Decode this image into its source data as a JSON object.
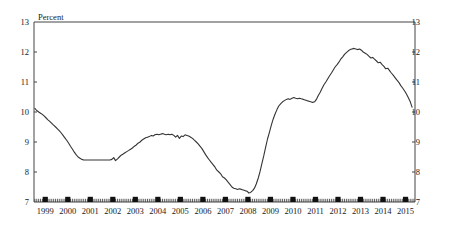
{
  "chart_data": {
    "type": "line",
    "title": "",
    "unit_label": "Percent",
    "xlabel": "",
    "ylabel": "Percent",
    "ylim": [
      7,
      13
    ],
    "yticks": [
      7,
      8,
      9,
      10,
      11,
      12,
      13
    ],
    "ytick_labels": [
      "7",
      "8",
      "9",
      "10",
      "11",
      "12",
      "13"
    ],
    "right_axis_ticks": [
      7,
      8,
      9,
      10,
      11,
      12,
      13
    ],
    "right_axis_tick_labels": [
      "7",
      "8",
      "9",
      "10",
      "11",
      "12",
      "13"
    ],
    "xlim": [
      1999.0,
      2015.92
    ],
    "xticks": [
      1999,
      2000,
      2001,
      2002,
      2003,
      2004,
      2005,
      2006,
      2007,
      2008,
      2009,
      2010,
      2011,
      2012,
      2013,
      2014,
      2015
    ],
    "xtick_labels": [
      "1999",
      "2000",
      "2001",
      "2002",
      "2003",
      "2004",
      "2005",
      "2006",
      "2007",
      "2008",
      "2009",
      "2010",
      "2011",
      "2012",
      "2013",
      "2014",
      "2015"
    ],
    "grid": false,
    "legend": "none",
    "minor_ticks": "monthly",
    "year_markers": "filled squares at year midpoints on bottom axis",
    "line_color": "#333333",
    "series": [
      {
        "name": "Percent",
        "x": [
          1999.04,
          1999.12,
          1999.21,
          1999.29,
          1999.37,
          1999.46,
          1999.54,
          1999.62,
          1999.71,
          1999.79,
          1999.87,
          1999.96,
          2000.04,
          2000.12,
          2000.21,
          2000.29,
          2000.37,
          2000.46,
          2000.54,
          2000.62,
          2000.71,
          2000.79,
          2000.87,
          2000.96,
          2001.04,
          2001.12,
          2001.21,
          2001.29,
          2001.37,
          2001.46,
          2001.54,
          2001.62,
          2001.71,
          2001.79,
          2001.87,
          2001.96,
          2002.04,
          2002.12,
          2002.21,
          2002.29,
          2002.37,
          2002.46,
          2002.54,
          2002.62,
          2002.71,
          2002.79,
          2002.87,
          2002.96,
          2003.04,
          2003.12,
          2003.21,
          2003.29,
          2003.37,
          2003.46,
          2003.54,
          2003.62,
          2003.71,
          2003.79,
          2003.87,
          2003.96,
          2004.04,
          2004.12,
          2004.21,
          2004.29,
          2004.37,
          2004.46,
          2004.54,
          2004.62,
          2004.71,
          2004.79,
          2004.87,
          2004.96,
          2005.04,
          2005.12,
          2005.21,
          2005.29,
          2005.37,
          2005.46,
          2005.54,
          2005.62,
          2005.71,
          2005.79,
          2005.87,
          2005.96,
          2006.04,
          2006.12,
          2006.21,
          2006.29,
          2006.37,
          2006.46,
          2006.54,
          2006.62,
          2006.71,
          2006.79,
          2006.87,
          2006.96,
          2007.04,
          2007.12,
          2007.21,
          2007.29,
          2007.37,
          2007.46,
          2007.54,
          2007.62,
          2007.71,
          2007.79,
          2007.87,
          2007.96,
          2008.04,
          2008.12,
          2008.21,
          2008.29,
          2008.37,
          2008.46,
          2008.54,
          2008.62,
          2008.71,
          2008.79,
          2008.87,
          2008.96,
          2009.04,
          2009.12,
          2009.21,
          2009.29,
          2009.37,
          2009.46,
          2009.54,
          2009.62,
          2009.71,
          2009.79,
          2009.87,
          2009.96,
          2010.04,
          2010.12,
          2010.21,
          2010.29,
          2010.37,
          2010.46,
          2010.54,
          2010.62,
          2010.71,
          2010.79,
          2010.87,
          2010.96,
          2011.04,
          2011.12,
          2011.21,
          2011.29,
          2011.37,
          2011.46,
          2011.54,
          2011.62,
          2011.71,
          2011.79,
          2011.87,
          2011.96,
          2012.04,
          2012.12,
          2012.21,
          2012.29,
          2012.37,
          2012.46,
          2012.54,
          2012.62,
          2012.71,
          2012.79,
          2012.87,
          2012.96,
          2013.04,
          2013.12,
          2013.21,
          2013.29,
          2013.37,
          2013.46,
          2013.54,
          2013.62,
          2013.71,
          2013.79,
          2013.87,
          2013.96,
          2014.04,
          2014.12,
          2014.21,
          2014.29,
          2014.37,
          2014.46,
          2014.54,
          2014.62,
          2014.71,
          2014.79,
          2014.87,
          2014.96,
          2015.04,
          2015.12,
          2015.21,
          2015.29,
          2015.37,
          2015.46,
          2015.54,
          2015.62,
          2015.71,
          2015.79
        ],
        "values": [
          10.12,
          10.05,
          10.0,
          9.96,
          9.92,
          9.86,
          9.8,
          9.74,
          9.68,
          9.62,
          9.56,
          9.5,
          9.44,
          9.38,
          9.3,
          9.22,
          9.14,
          9.05,
          8.96,
          8.86,
          8.76,
          8.66,
          8.58,
          8.5,
          8.46,
          8.42,
          8.4,
          8.4,
          8.4,
          8.4,
          8.4,
          8.4,
          8.4,
          8.4,
          8.4,
          8.4,
          8.4,
          8.4,
          8.4,
          8.4,
          8.4,
          8.42,
          8.48,
          8.38,
          8.44,
          8.5,
          8.56,
          8.6,
          8.64,
          8.68,
          8.72,
          8.76,
          8.8,
          8.86,
          8.9,
          8.96,
          9.0,
          9.06,
          9.1,
          9.14,
          9.16,
          9.18,
          9.22,
          9.2,
          9.24,
          9.26,
          9.24,
          9.26,
          9.28,
          9.26,
          9.24,
          9.26,
          9.24,
          9.26,
          9.22,
          9.16,
          9.22,
          9.12,
          9.2,
          9.18,
          9.24,
          9.22,
          9.2,
          9.16,
          9.12,
          9.06,
          9.0,
          8.94,
          8.86,
          8.78,
          8.68,
          8.58,
          8.48,
          8.4,
          8.32,
          8.24,
          8.16,
          8.06,
          8.0,
          7.94,
          7.84,
          7.8,
          7.74,
          7.66,
          7.58,
          7.5,
          7.46,
          7.44,
          7.42,
          7.44,
          7.42,
          7.4,
          7.38,
          7.36,
          7.3,
          7.32,
          7.38,
          7.46,
          7.6,
          7.8,
          8.02,
          8.28,
          8.56,
          8.84,
          9.1,
          9.34,
          9.56,
          9.76,
          9.94,
          10.08,
          10.2,
          10.28,
          10.34,
          10.38,
          10.42,
          10.44,
          10.42,
          10.46,
          10.48,
          10.46,
          10.44,
          10.46,
          10.44,
          10.42,
          10.4,
          10.38,
          10.36,
          10.34,
          10.32,
          10.34,
          10.42,
          10.54,
          10.66,
          10.78,
          10.9,
          11.0,
          11.1,
          11.2,
          11.3,
          11.4,
          11.5,
          11.58,
          11.66,
          11.76,
          11.84,
          11.92,
          11.98,
          12.04,
          12.08,
          12.1,
          12.12,
          12.1,
          12.08,
          12.1,
          12.06,
          12.0,
          11.96,
          11.92,
          11.86,
          11.8,
          11.82,
          11.76,
          11.7,
          11.64,
          11.66,
          11.58,
          11.52,
          11.44,
          11.46,
          11.38,
          11.3,
          11.22,
          11.14,
          11.06,
          10.98,
          10.88,
          10.8,
          10.7,
          10.6,
          10.48,
          10.34,
          10.16
        ]
      }
    ]
  }
}
